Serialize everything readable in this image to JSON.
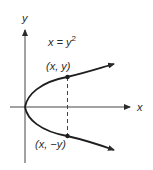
{
  "diagram": {
    "equation": "x = y",
    "equation_exp": "2",
    "axis_x_label": "x",
    "axis_y_label": "y",
    "point_upper_label": "(x, y)",
    "point_lower_label": "(x, −y)",
    "colors": {
      "ink": "#2a2a2a",
      "background": "#ffffff"
    }
  }
}
